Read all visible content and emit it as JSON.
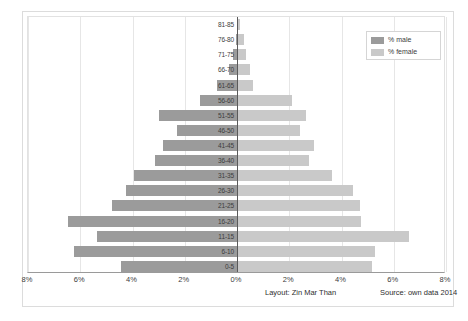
{
  "chart_data": {
    "type": "bar",
    "subtype": "population-pyramid",
    "title": "",
    "xlabel": "",
    "ylabel": "",
    "categories": [
      "81-85",
      "76-80",
      "71-75",
      "66-70",
      "61-65",
      "56-60",
      "51-55",
      "46-50",
      "41-45",
      "36-40",
      "31-35",
      "26-30",
      "21-25",
      "16-20",
      "11-15",
      "6-10",
      "0-5"
    ],
    "series": [
      {
        "name": "% male",
        "color": "#9b9b9b",
        "side": "left",
        "values": [
          0.0,
          0.05,
          0.15,
          0.3,
          0.75,
          1.4,
          3.0,
          2.3,
          2.85,
          3.15,
          3.95,
          4.25,
          4.8,
          6.45,
          5.35,
          6.25,
          4.45
        ]
      },
      {
        "name": "% female",
        "color": "#c9c9c9",
        "side": "right",
        "values": [
          0.1,
          0.25,
          0.35,
          0.5,
          0.6,
          2.1,
          2.65,
          2.4,
          2.95,
          2.75,
          3.65,
          4.45,
          4.7,
          4.75,
          6.6,
          5.3,
          5.15
        ]
      }
    ],
    "xlim": [
      -8,
      8
    ],
    "xticks": [
      -8,
      -6,
      -4,
      -2,
      0,
      2,
      4,
      6,
      8
    ],
    "xtick_labels": [
      "8%",
      "6%",
      "4%",
      "2%",
      "0%",
      "2%",
      "4%",
      "6%",
      "8%"
    ],
    "grid": true,
    "grid_axis": "x",
    "legend_position": "top-right"
  },
  "legend": {
    "items": [
      {
        "label": "% male",
        "color": "#9b9b9b",
        "swatch": "male-swatch"
      },
      {
        "label": "% female",
        "color": "#c9c9c9",
        "swatch": "female-swatch"
      }
    ]
  },
  "footer": {
    "layout_credit": "Layout: Zin Mar Than",
    "source_credit": "Source: own data 2014"
  },
  "colors": {
    "male": "#9b9b9b",
    "female": "#c9c9c9",
    "grid": "#e6e6e6",
    "axis": "#5a5a5a",
    "text": "#3d3d3d",
    "background": "#ffffff"
  }
}
